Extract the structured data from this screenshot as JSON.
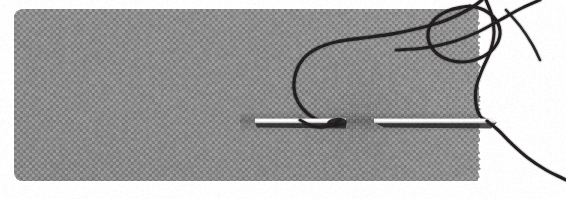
{
  "image": {
    "kind": "macro-photograph",
    "subject": "sewing-needle-through-fabric",
    "description": "Close-up photograph of a steel sewing needle passing horizontally through a piece of gray woven fabric, with a dark thread looping above the fabric and trailing off to the right over a white background.",
    "width": 566,
    "height": 199,
    "background_color": "#ffffff",
    "corner_radius": 12
  },
  "fabric": {
    "label": "gray woven fabric swatch",
    "base_color": "#8c8c8c",
    "light_color": "#9e9e9e",
    "dark_color": "#6f6f6f",
    "shadow_color": "#5d5d5d",
    "weave_thread_color": "#b4b4b4",
    "x": 14,
    "y": 9,
    "right_edge": 478,
    "bottom_edge": 181,
    "corner_radius": 10,
    "right_edge_style": "frayed",
    "weave_cell": 3
  },
  "needle": {
    "label": "steel sewing needle",
    "highlight_color": "#fdfdfd",
    "body_color": "#e8e8e8",
    "shadow_color": "#3a3a3a",
    "axis_y": 121,
    "left_segment": {
      "x_start": 255,
      "x_end": 346
    },
    "right_segment": {
      "x_start": 374,
      "x_end": 497
    },
    "eye_x": 340,
    "tip_x": 497
  },
  "thread": {
    "label": "dark sewing thread",
    "color": "#231f20",
    "highlight_color": "#5a5a5a",
    "width": 3.2,
    "strand_count": 5,
    "strands": [
      {
        "name": "needle-eye-loop",
        "note": "rises from the needle eye, arcs left then sweeps right across the upper fabric"
      },
      {
        "name": "upper-coil",
        "note": "circular coil crossing near the top right of the fabric"
      },
      {
        "name": "crossing-strand",
        "note": "diagonal strand crossing the coil toward the top right corner"
      },
      {
        "name": "descending-strand",
        "note": "runs down the frayed fabric edge to the needle axis"
      },
      {
        "name": "trailing-tail",
        "note": "curves down and right from the needle tip across the white background"
      }
    ]
  },
  "palette": {
    "white": "#ffffff",
    "fabric_gray": "#8c8c8c",
    "thread_black": "#231f20",
    "needle_silver": "#fdfdfd"
  }
}
